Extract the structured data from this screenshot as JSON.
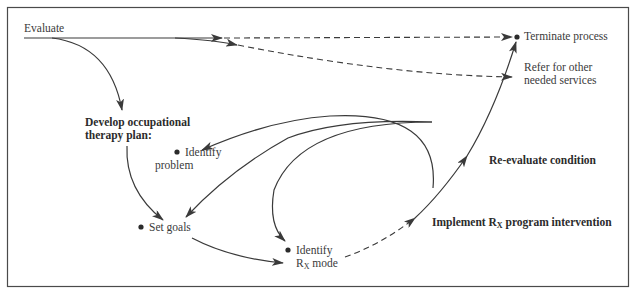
{
  "diagram": {
    "colors": {
      "line": "#3a3a3a",
      "frame": "#4a4a4a",
      "text": "#3a3a3a",
      "background": "#ffffff"
    },
    "nodes": {
      "evaluate": {
        "label": "Evaluate"
      },
      "terminate": {
        "label": "Terminate process"
      },
      "refer": {
        "line1": "Refer for other",
        "line2": "needed services"
      },
      "develop_plan": {
        "line1": "Develop occupational",
        "line2": "therapy plan:"
      },
      "identify_problem": {
        "line1": "Identify",
        "line2": "problem"
      },
      "set_goals": {
        "label": "Set goals"
      },
      "identify_rx_mode": {
        "line1": "Identify",
        "rx_main": "R",
        "rx_sub": "X",
        "rx_rest": " mode"
      },
      "implement": {
        "prefix": "Implement ",
        "rx_main": "R",
        "rx_sub": "X",
        "suffix": " program intervention"
      },
      "reevaluate": {
        "label": "Re-evaluate condition"
      }
    },
    "edges": [
      {
        "from": "Evaluate",
        "to": "Terminate process",
        "style": "solid-then-dashed"
      },
      {
        "from": "Evaluate",
        "to": "Refer for other needed services",
        "style": "solid-then-dashed"
      },
      {
        "from": "Evaluate",
        "to": "Develop occupational therapy plan",
        "style": "solid"
      },
      {
        "from": "Develop occupational therapy plan",
        "to": "Set goals",
        "style": "solid"
      },
      {
        "from": "Re-evaluate condition",
        "to": "Identify problem",
        "style": "solid"
      },
      {
        "from": "Re-evaluate condition",
        "to": "Set goals",
        "style": "solid"
      },
      {
        "from": "Re-evaluate condition",
        "to": "Identify Rx mode",
        "style": "solid"
      },
      {
        "from": "Set goals",
        "to": "Identify Rx mode",
        "style": "solid"
      },
      {
        "from": "Identify Rx mode",
        "to": "Implement Rx program intervention",
        "style": "dashed"
      },
      {
        "from": "Implement Rx program intervention",
        "to": "Re-evaluate condition",
        "style": "solid"
      },
      {
        "from": "Re-evaluate condition",
        "to": "Terminate process",
        "style": "solid"
      }
    ]
  }
}
